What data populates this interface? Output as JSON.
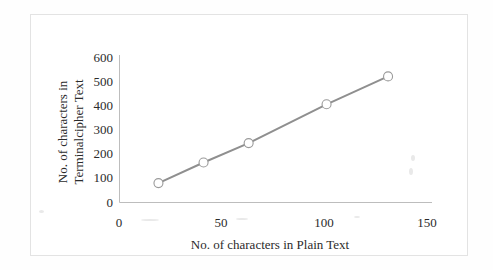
{
  "figure": {
    "caption_present": false,
    "background_color": "#ffffff",
    "border_color": "#e3e3e3"
  },
  "chart_data": {
    "type": "line",
    "title": "",
    "xlabel": "No. of characters in Plain Text",
    "ylabel": "No. of characters in Terminalcipher Text",
    "ylabel_line1": "No. of characters in",
    "ylabel_line2": "Terminalcipher Text",
    "x": [
      19,
      41,
      63,
      101,
      131
    ],
    "values": [
      80,
      165,
      245,
      405,
      520
    ],
    "series": [
      {
        "name": "Terminalcipher Text length",
        "x": [
          19,
          41,
          63,
          101,
          131
        ],
        "values": [
          80,
          165,
          245,
          405,
          520
        ]
      }
    ],
    "xlim": [
      0,
      150
    ],
    "ylim": [
      0,
      600
    ],
    "xticks": [
      0,
      50,
      100,
      150
    ],
    "yticks": [
      0,
      100,
      200,
      300,
      400,
      500,
      600
    ],
    "xtick_labels": [
      "0",
      "50",
      "100",
      "150"
    ],
    "ytick_labels": [
      "0",
      "100",
      "200",
      "300",
      "400",
      "500",
      "600"
    ],
    "grid": false,
    "legend": false,
    "legend_position": "none",
    "line_color": "#8f8f8f",
    "line_width": 2,
    "marker": "circle-open",
    "marker_edge_color": "#9a9a9a",
    "marker_face_color": "#ffffff",
    "marker_size": 9,
    "axis_color": "#bdbdbd",
    "text_color": "#2b2b2b"
  }
}
